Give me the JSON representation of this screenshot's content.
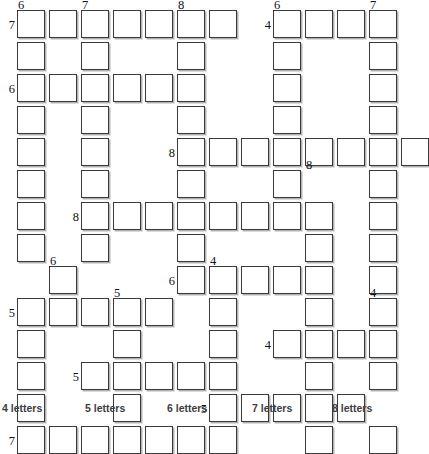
{
  "puzzle": {
    "title": "Crossword fill-in grid",
    "grid": {
      "origin_x": 17,
      "origin_y": 10,
      "cell_size": 28,
      "pitch": 32,
      "columns": 12,
      "rows": 13,
      "cell_fill": "#ffffff",
      "cell_border": "#3a3a3a",
      "shadow": "rgba(0,0,0,0.30)",
      "cells": [
        [
          0,
          0
        ],
        [
          1,
          0
        ],
        [
          2,
          0
        ],
        [
          3,
          0
        ],
        [
          4,
          0
        ],
        [
          5,
          0
        ],
        [
          6,
          0
        ],
        [
          8,
          0
        ],
        [
          9,
          0
        ],
        [
          10,
          0
        ],
        [
          11,
          0
        ],
        [
          0,
          1
        ],
        [
          2,
          1
        ],
        [
          5,
          1
        ],
        [
          8,
          1
        ],
        [
          11,
          1
        ],
        [
          0,
          2
        ],
        [
          1,
          2
        ],
        [
          2,
          2
        ],
        [
          3,
          2
        ],
        [
          4,
          2
        ],
        [
          5,
          2
        ],
        [
          8,
          2
        ],
        [
          11,
          2
        ],
        [
          0,
          3
        ],
        [
          2,
          3
        ],
        [
          5,
          3
        ],
        [
          8,
          3
        ],
        [
          11,
          3
        ],
        [
          0,
          4
        ],
        [
          2,
          4
        ],
        [
          5,
          4
        ],
        [
          6,
          4
        ],
        [
          7,
          4
        ],
        [
          8,
          4
        ],
        [
          9,
          4
        ],
        [
          10,
          4
        ],
        [
          11,
          4
        ],
        [
          12,
          4
        ],
        [
          0,
          5
        ],
        [
          2,
          5
        ],
        [
          5,
          5
        ],
        [
          8,
          5
        ],
        [
          11,
          5
        ],
        [
          0,
          6
        ],
        [
          2,
          6
        ],
        [
          3,
          6
        ],
        [
          4,
          6
        ],
        [
          5,
          6
        ],
        [
          6,
          6
        ],
        [
          7,
          6
        ],
        [
          8,
          6
        ],
        [
          9,
          6
        ],
        [
          11,
          6
        ],
        [
          0,
          7
        ],
        [
          2,
          7
        ],
        [
          5,
          7
        ],
        [
          9,
          7
        ],
        [
          11,
          7
        ],
        [
          1,
          8
        ],
        [
          5,
          8
        ],
        [
          6,
          8
        ],
        [
          7,
          8
        ],
        [
          8,
          8
        ],
        [
          9,
          8
        ],
        [
          11,
          8
        ],
        [
          0,
          9
        ],
        [
          1,
          9
        ],
        [
          2,
          9
        ],
        [
          3,
          9
        ],
        [
          4,
          9
        ],
        [
          6,
          9
        ],
        [
          9,
          9
        ],
        [
          11,
          9
        ],
        [
          0,
          10
        ],
        [
          3,
          10
        ],
        [
          6,
          10
        ],
        [
          8,
          10
        ],
        [
          9,
          10
        ],
        [
          10,
          10
        ],
        [
          11,
          10
        ],
        [
          0,
          11
        ],
        [
          2,
          11
        ],
        [
          3,
          11
        ],
        [
          4,
          11
        ],
        [
          5,
          11
        ],
        [
          6,
          11
        ],
        [
          9,
          11
        ],
        [
          11,
          11
        ],
        [
          0,
          12
        ],
        [
          3,
          12
        ],
        [
          6,
          12
        ],
        [
          7,
          12
        ],
        [
          8,
          12
        ],
        [
          9,
          12
        ],
        [
          10,
          12
        ],
        [
          0,
          13
        ],
        [
          1,
          13
        ],
        [
          2,
          13
        ],
        [
          3,
          13
        ],
        [
          4,
          13
        ],
        [
          5,
          13
        ],
        [
          6,
          13
        ],
        [
          9,
          13
        ],
        [
          11,
          13
        ]
      ]
    },
    "clue_numbers": [
      {
        "text": "6",
        "col": 0,
        "row": 0,
        "pos": "top"
      },
      {
        "text": "7",
        "col": 2,
        "row": 0,
        "pos": "top"
      },
      {
        "text": "8",
        "col": 5,
        "row": 0,
        "pos": "top"
      },
      {
        "text": "6",
        "col": 8,
        "row": 0,
        "pos": "top"
      },
      {
        "text": "7",
        "col": 11,
        "row": 0,
        "pos": "top"
      },
      {
        "text": "7",
        "col": 0,
        "row": 0,
        "pos": "left"
      },
      {
        "text": "4",
        "col": 8,
        "row": 0,
        "pos": "left"
      },
      {
        "text": "6",
        "col": 0,
        "row": 2,
        "pos": "left"
      },
      {
        "text": "8",
        "col": 5,
        "row": 4,
        "pos": "left"
      },
      {
        "text": "8",
        "col": 9,
        "row": 5,
        "pos": "top"
      },
      {
        "text": "8",
        "col": 2,
        "row": 6,
        "pos": "left"
      },
      {
        "text": "6",
        "col": 1,
        "row": 8,
        "pos": "top"
      },
      {
        "text": "4",
        "col": 6,
        "row": 8,
        "pos": "top"
      },
      {
        "text": "6",
        "col": 5,
        "row": 8,
        "pos": "left"
      },
      {
        "text": "5",
        "col": 3,
        "row": 9,
        "pos": "top"
      },
      {
        "text": "5",
        "col": 0,
        "row": 9,
        "pos": "left"
      },
      {
        "text": "4",
        "col": 11,
        "row": 9,
        "pos": "top"
      },
      {
        "text": "4",
        "col": 8,
        "row": 10,
        "pos": "left"
      },
      {
        "text": "5",
        "col": 2,
        "row": 11,
        "pos": "left"
      },
      {
        "text": "5",
        "col": 6,
        "row": 12,
        "pos": "left"
      },
      {
        "text": "7",
        "col": 0,
        "row": 13,
        "pos": "left"
      }
    ],
    "legend": [
      {
        "label": "4 letters",
        "x": 2
      },
      {
        "label": "5 letters",
        "x": 85
      },
      {
        "label": "6 letters",
        "x": 167
      },
      {
        "label": "7 letters",
        "x": 252
      },
      {
        "label": "8 letters",
        "x": 332
      }
    ]
  }
}
